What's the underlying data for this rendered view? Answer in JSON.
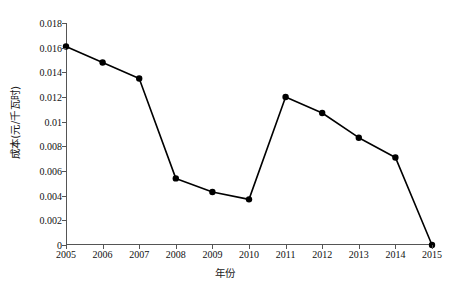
{
  "chart_data": {
    "type": "line",
    "title": "",
    "subtitle": "",
    "xlabel": "年份",
    "ylabel": "成本(元/千瓦时)",
    "categories": [
      "2005",
      "2006",
      "2007",
      "2008",
      "2009",
      "2010",
      "2011",
      "2012",
      "2013",
      "2014",
      "2015"
    ],
    "x": [
      2005,
      2006,
      2007,
      2008,
      2009,
      2010,
      2011,
      2012,
      2013,
      2014,
      2015
    ],
    "values": [
      0.0161,
      0.0148,
      0.0135,
      0.0054,
      0.0043,
      0.0037,
      0.012,
      0.0107,
      0.0087,
      0.0071,
      0
    ],
    "series": [
      {
        "name": "成本",
        "values": [
          0.0161,
          0.0148,
          0.0135,
          0.0054,
          0.0043,
          0.0037,
          0.012,
          0.0107,
          0.0087,
          0.0071,
          0
        ]
      }
    ],
    "ylim": [
      0,
      0.018
    ],
    "xlim": [
      2005,
      2015
    ],
    "ytick_labels": [
      "0.018",
      "0.016",
      "0.014",
      "0.012",
      "0.01",
      "0.008",
      "0.006",
      "0.004",
      "0.002",
      "0"
    ],
    "ytick_values": [
      0.018,
      0.016,
      0.014,
      0.012,
      0.01,
      0.008,
      0.006,
      0.004,
      0.002,
      0
    ],
    "xtick_labels": [
      "2005",
      "2006",
      "2007",
      "2008",
      "2009",
      "2010",
      "2011",
      "2012",
      "2013",
      "2014",
      "2015"
    ],
    "grid": false,
    "legend": false,
    "legend_position": "none",
    "marker": "filled-circle",
    "line_color": "#000000",
    "marker_color": "#000000",
    "axis_color": "#555555",
    "background_color": "#ffffff"
  }
}
